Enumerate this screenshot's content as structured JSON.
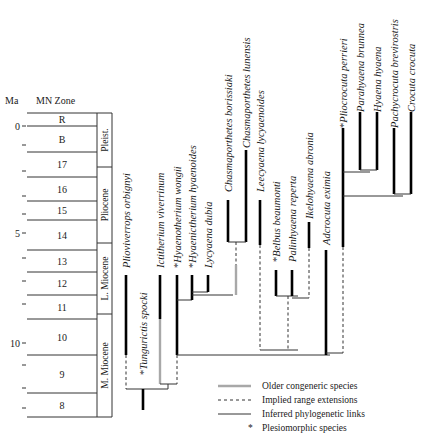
{
  "axis": {
    "ma_label": "Ma",
    "zone_label": "MN Zone",
    "ticks": [
      {
        "label": "0",
        "y": 126
      },
      {
        "label": "",
        "y": 145
      },
      {
        "label": "",
        "y": 171
      },
      {
        "label": "",
        "y": 196
      },
      {
        "label": "",
        "y": 214
      },
      {
        "label": "5",
        "y": 233
      },
      {
        "label": "",
        "y": 258
      },
      {
        "label": "",
        "y": 281
      },
      {
        "label": "",
        "y": 304
      },
      {
        "label": "10",
        "y": 343
      },
      {
        "label": "",
        "y": 365
      },
      {
        "label": "",
        "y": 388
      },
      {
        "label": "",
        "y": 408
      }
    ]
  },
  "zones": [
    {
      "label": "R",
      "top": 113,
      "bottom": 126
    },
    {
      "label": "B",
      "top": 126,
      "bottom": 152
    },
    {
      "label": "17",
      "top": 152,
      "bottom": 177
    },
    {
      "label": "16",
      "top": 177,
      "bottom": 201
    },
    {
      "label": "15",
      "top": 201,
      "bottom": 220
    },
    {
      "label": "14",
      "top": 220,
      "bottom": 250
    },
    {
      "label": "13",
      "top": 250,
      "bottom": 272
    },
    {
      "label": "12",
      "top": 272,
      "bottom": 295
    },
    {
      "label": "11",
      "top": 295,
      "bottom": 319
    },
    {
      "label": "10",
      "top": 319,
      "bottom": 355
    },
    {
      "label": "9",
      "top": 355,
      "bottom": 393
    },
    {
      "label": "8",
      "top": 393,
      "bottom": 417
    }
  ],
  "epochs": [
    {
      "label": "Pleist.",
      "top": 113,
      "bottom": 167
    },
    {
      "label": "Pliocene",
      "top": 167,
      "bottom": 243
    },
    {
      "label": "L. Miocene",
      "top": 243,
      "bottom": 314
    },
    {
      "label": "M. Miocene",
      "top": 314,
      "bottom": 417
    }
  ],
  "taxa": [
    {
      "name": "Plioviverrops orbignyi",
      "plesiomorphic": false,
      "x": 126,
      "label_y": 268
    },
    {
      "name": "Tungurictis spocki",
      "plesiomorphic": true,
      "x": 143,
      "label_y": 375
    },
    {
      "name": "Ictitherium viverrinum",
      "plesiomorphic": false,
      "x": 160,
      "label_y": 268
    },
    {
      "name": "Hyaenotherium wongii",
      "plesiomorphic": true,
      "x": 177,
      "label_y": 268
    },
    {
      "name": "Hyaenictherium hyaenoides",
      "plesiomorphic": true,
      "x": 192,
      "label_y": 268
    },
    {
      "name": "Lycyaena dubia",
      "plesiomorphic": false,
      "x": 208,
      "label_y": 268
    },
    {
      "name": "Chasmaporthetes borissiaki",
      "plesiomorphic": false,
      "x": 228,
      "label_y": 192
    },
    {
      "name": "Chasmaporthetes lunensis",
      "plesiomorphic": false,
      "x": 246,
      "label_y": 148
    },
    {
      "name": "Leecyaena lycyaenoides",
      "plesiomorphic": false,
      "x": 260,
      "label_y": 192
    },
    {
      "name": "Belbus beaumonti",
      "plesiomorphic": true,
      "x": 276,
      "label_y": 262
    },
    {
      "name": "Palinhyaena reperta",
      "plesiomorphic": false,
      "x": 292,
      "label_y": 262
    },
    {
      "name": "Ikelohyaena abronia",
      "plesiomorphic": false,
      "x": 309,
      "label_y": 219
    },
    {
      "name": "Adcrocuta eximia",
      "plesiomorphic": false,
      "x": 326,
      "label_y": 245
    },
    {
      "name": "Pliocrocuta perrieri",
      "plesiomorphic": true,
      "x": 343,
      "label_y": 128
    },
    {
      "name": "Parahyaena brunnea",
      "plesiomorphic": false,
      "x": 360,
      "label_y": 112
    },
    {
      "name": "Hyaena hyaena",
      "plesiomorphic": false,
      "x": 377,
      "label_y": 112
    },
    {
      "name": "Pachycrocuta brevirostris",
      "plesiomorphic": false,
      "x": 394,
      "label_y": 128
    },
    {
      "name": "Crocuta crocuta",
      "plesiomorphic": false,
      "x": 411,
      "label_y": 112
    }
  ],
  "legend": {
    "items": [
      {
        "style": "older",
        "label": "Older congeneric species"
      },
      {
        "style": "implied",
        "label": "Implied range extensions"
      },
      {
        "style": "inferred",
        "label": "Inferred phylogenetic links"
      },
      {
        "style": "asterisk",
        "symbol": "*",
        "label": "Plesiomorphic species"
      }
    ]
  },
  "colors": {
    "range_bar": "#000000",
    "older_congeneric": "#a8a8a8",
    "line": "#333333"
  }
}
